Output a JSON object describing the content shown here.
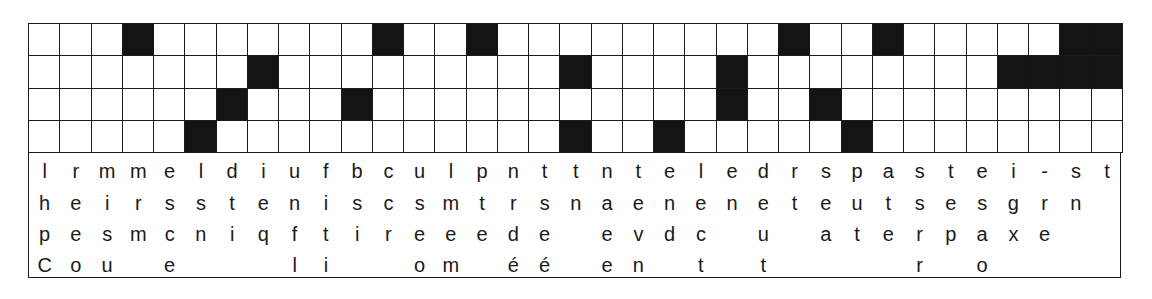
{
  "grid": {
    "rows": 4,
    "cols": 35,
    "cell_color_filled": "#141414",
    "cell_color_empty": "#ffffff",
    "filled_cells": [
      [
        3,
        11,
        14,
        24,
        27,
        33,
        34
      ],
      [
        7,
        17,
        22,
        31,
        32,
        33,
        34
      ],
      [
        6,
        10,
        22,
        25
      ],
      [
        5,
        17,
        20,
        26
      ]
    ]
  },
  "letter_rows": [
    [
      "l",
      "r",
      "m",
      "m",
      "e",
      "l",
      "d",
      "i",
      "u",
      "f",
      "b",
      "c",
      "u",
      "l",
      "p",
      "n",
      "t",
      "t",
      "n",
      "t",
      "e",
      "l",
      "e",
      "d",
      "r",
      "s",
      "p",
      "a",
      "s",
      "t",
      "e",
      "i",
      "-",
      "s",
      "t"
    ],
    [
      "h",
      "e",
      "i",
      "r",
      "s",
      "s",
      "t",
      "e",
      "n",
      "i",
      "s",
      "c",
      "s",
      "m",
      "t",
      "r",
      "s",
      "n",
      "a",
      "e",
      "n",
      "e",
      "n",
      "e",
      "t",
      "e",
      "u",
      "t",
      "s",
      "e",
      "s",
      "g",
      "r",
      "n",
      ""
    ],
    [
      "p",
      "e",
      "s",
      "m",
      "c",
      "n",
      "i",
      "q",
      "f",
      "t",
      "i",
      "r",
      "e",
      "e",
      "e",
      "d",
      "e",
      "",
      "e",
      "v",
      "d",
      "c",
      "",
      "u",
      "",
      "a",
      "t",
      "e",
      "r",
      "p",
      "a",
      "x",
      "e",
      "",
      ""
    ],
    [
      "C",
      "o",
      "u",
      "",
      "e",
      "",
      "",
      "",
      "l",
      "i",
      "",
      "",
      "o",
      "m",
      "",
      "é",
      "é",
      "",
      "e",
      "n",
      "",
      "t",
      "",
      "t",
      "",
      "",
      "",
      "",
      "r",
      "",
      "o",
      "",
      "",
      "",
      ""
    ]
  ]
}
